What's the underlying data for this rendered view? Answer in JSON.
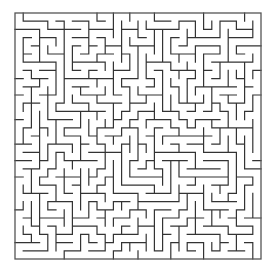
{
  "maze": {
    "cols": 30,
    "rows": 30,
    "origin_x": 15,
    "origin_y": 13,
    "cell": 8.2,
    "wall_color": "#333333",
    "border_color": "#555555",
    "background": "#ffffff",
    "seed": 1337,
    "entrance": {
      "side": "top",
      "col": 0
    },
    "exit": {
      "side": "bottom",
      "col": 29
    }
  }
}
